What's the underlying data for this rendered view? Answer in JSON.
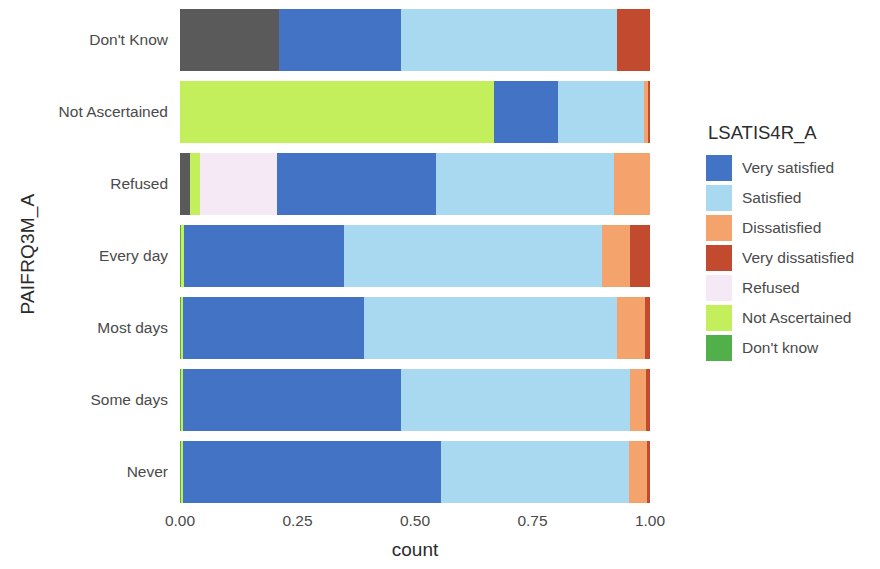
{
  "axes": {
    "y_title": "PAIFRQ3M_A",
    "x_title": "count",
    "x_ticks": [
      "0.00",
      "0.25",
      "0.50",
      "0.75",
      "1.00"
    ],
    "y_ticks": [
      "Don't Know",
      "Not Ascertained",
      "Refused",
      "Every day",
      "Most days",
      "Some days",
      "Never"
    ]
  },
  "legend": {
    "title": "LSATIS4R_A",
    "items": [
      {
        "label": "Very satisfied",
        "color": "#4373c4"
      },
      {
        "label": "Satisfied",
        "color": "#a8d9f0"
      },
      {
        "label": "Dissatisfied",
        "color": "#f4a36c"
      },
      {
        "label": "Very dissatisfied",
        "color": "#c24a2e"
      },
      {
        "label": "Refused",
        "color": "#f6e9f6"
      },
      {
        "label": "Not Ascertained",
        "color": "#c4ef5c"
      },
      {
        "label": "Don't know",
        "color": "#52b04a"
      }
    ]
  },
  "chart_data": {
    "type": "bar",
    "orientation": "horizontal",
    "stacked": true,
    "normalized": true,
    "title": "",
    "xlabel": "count",
    "ylabel": "PAIFRQ3M_A",
    "xlim": [
      0,
      1
    ],
    "grid": false,
    "legend_position": "right",
    "legend_title": "LSATIS4R_A",
    "categories": [
      "Don't Know",
      "Not Ascertained",
      "Refused",
      "Every day",
      "Most days",
      "Some days",
      "Never"
    ],
    "series": [
      {
        "name": "Very satisfied",
        "color": "#4373c4",
        "values": [
          0.26,
          0.136,
          0.12,
          0.34,
          0.385,
          0.465,
          0.55
        ]
      },
      {
        "name": "Satisfied",
        "color": "#a8d9f0",
        "values": [
          0.46,
          0.183,
          0.197,
          0.55,
          0.537,
          0.487,
          0.4
        ]
      },
      {
        "name": "Dissatisfied",
        "color": "#f4a36c",
        "values": [
          0.0,
          0.008,
          0.076,
          0.059,
          0.06,
          0.033,
          0.038
        ]
      },
      {
        "name": "Very dissatisfied",
        "color": "#c24a2e",
        "values": [
          0.07,
          0.004,
          0.0,
          0.043,
          0.011,
          0.009,
          0.006
        ]
      },
      {
        "name": "Refused",
        "color": "#f6e9f6",
        "values": [
          0.0,
          0.0,
          0.165,
          0.0,
          0.0,
          0.0,
          0.0
        ]
      },
      {
        "name": "Not Ascertained",
        "color": "#c4ef5c",
        "values": [
          0.0,
          0.669,
          0.021,
          0.005,
          0.004,
          0.004,
          0.004
        ]
      },
      {
        "name": "Don't know",
        "color": "#52b04a",
        "values": [
          0.0,
          0.0,
          0.0,
          0.003,
          0.003,
          0.002,
          0.002
        ]
      },
      {
        "name": "NA",
        "color": "#5a5a5a",
        "values": [
          0.21,
          0.0,
          0.021,
          0.0,
          0.0,
          0.0,
          0.0
        ]
      }
    ],
    "bar_stacks": [
      {
        "category": "Don't Know",
        "segments": [
          {
            "name": "NA",
            "color": "#5a5a5a",
            "start": 0.0,
            "end": 0.21
          },
          {
            "name": "Very satisfied",
            "color": "#4373c4",
            "start": 0.21,
            "end": 0.47
          },
          {
            "name": "Satisfied",
            "color": "#a8d9f0",
            "start": 0.47,
            "end": 0.93
          },
          {
            "name": "Very dissatisfied",
            "color": "#c24a2e",
            "start": 0.93,
            "end": 1.0
          }
        ]
      },
      {
        "category": "Not Ascertained",
        "segments": [
          {
            "name": "Not Ascertained",
            "color": "#c4ef5c",
            "start": 0.0,
            "end": 0.669
          },
          {
            "name": "Very satisfied",
            "color": "#4373c4",
            "start": 0.669,
            "end": 0.805
          },
          {
            "name": "Satisfied",
            "color": "#a8d9f0",
            "start": 0.805,
            "end": 0.988
          },
          {
            "name": "Dissatisfied",
            "color": "#f4a36c",
            "start": 0.988,
            "end": 0.996
          },
          {
            "name": "Very dissatisfied",
            "color": "#c24a2e",
            "start": 0.996,
            "end": 1.0
          }
        ]
      },
      {
        "category": "Refused",
        "segments": [
          {
            "name": "NA",
            "color": "#5a5a5a",
            "start": 0.0,
            "end": 0.021
          },
          {
            "name": "Not Ascertained",
            "color": "#c4ef5c",
            "start": 0.021,
            "end": 0.042
          },
          {
            "name": "Refused",
            "color": "#f6e9f6",
            "start": 0.042,
            "end": 0.207
          },
          {
            "name": "Very satisfied",
            "color": "#4373c4",
            "start": 0.207,
            "end": 0.545
          },
          {
            "name": "Satisfied",
            "color": "#a8d9f0",
            "start": 0.545,
            "end": 0.924
          },
          {
            "name": "Dissatisfied",
            "color": "#f4a36c",
            "start": 0.924,
            "end": 1.0
          }
        ]
      },
      {
        "category": "Every day",
        "segments": [
          {
            "name": "Don't know",
            "color": "#52b04a",
            "start": 0.0,
            "end": 0.003
          },
          {
            "name": "Not Ascertained",
            "color": "#c4ef5c",
            "start": 0.003,
            "end": 0.008
          },
          {
            "name": "Very satisfied",
            "color": "#4373c4",
            "start": 0.008,
            "end": 0.348
          },
          {
            "name": "Satisfied",
            "color": "#a8d9f0",
            "start": 0.348,
            "end": 0.898
          },
          {
            "name": "Dissatisfied",
            "color": "#f4a36c",
            "start": 0.898,
            "end": 0.957
          },
          {
            "name": "Very dissatisfied",
            "color": "#c24a2e",
            "start": 0.957,
            "end": 1.0
          }
        ]
      },
      {
        "category": "Most days",
        "segments": [
          {
            "name": "Don't know",
            "color": "#52b04a",
            "start": 0.0,
            "end": 0.003
          },
          {
            "name": "Not Ascertained",
            "color": "#c4ef5c",
            "start": 0.003,
            "end": 0.007
          },
          {
            "name": "Very satisfied",
            "color": "#4373c4",
            "start": 0.007,
            "end": 0.392
          },
          {
            "name": "Satisfied",
            "color": "#a8d9f0",
            "start": 0.392,
            "end": 0.929
          },
          {
            "name": "Dissatisfied",
            "color": "#f4a36c",
            "start": 0.929,
            "end": 0.989
          },
          {
            "name": "Very dissatisfied",
            "color": "#c24a2e",
            "start": 0.989,
            "end": 1.0
          }
        ]
      },
      {
        "category": "Some days",
        "segments": [
          {
            "name": "Don't know",
            "color": "#52b04a",
            "start": 0.0,
            "end": 0.002
          },
          {
            "name": "Not Ascertained",
            "color": "#c4ef5c",
            "start": 0.002,
            "end": 0.006
          },
          {
            "name": "Very satisfied",
            "color": "#4373c4",
            "start": 0.006,
            "end": 0.471
          },
          {
            "name": "Satisfied",
            "color": "#a8d9f0",
            "start": 0.471,
            "end": 0.958
          },
          {
            "name": "Dissatisfied",
            "color": "#f4a36c",
            "start": 0.958,
            "end": 0.991
          },
          {
            "name": "Very dissatisfied",
            "color": "#c24a2e",
            "start": 0.991,
            "end": 1.0
          }
        ]
      },
      {
        "category": "Never",
        "segments": [
          {
            "name": "Don't know",
            "color": "#52b04a",
            "start": 0.0,
            "end": 0.002
          },
          {
            "name": "Not Ascertained",
            "color": "#c4ef5c",
            "start": 0.002,
            "end": 0.006
          },
          {
            "name": "Very satisfied",
            "color": "#4373c4",
            "start": 0.006,
            "end": 0.556
          },
          {
            "name": "Satisfied",
            "color": "#a8d9f0",
            "start": 0.556,
            "end": 0.956
          },
          {
            "name": "Dissatisfied",
            "color": "#f4a36c",
            "start": 0.956,
            "end": 0.994
          },
          {
            "name": "Very dissatisfied",
            "color": "#c24a2e",
            "start": 0.994,
            "end": 1.0
          }
        ]
      }
    ]
  }
}
